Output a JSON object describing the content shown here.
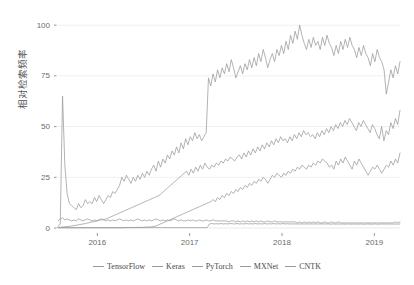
{
  "chart_data": {
    "type": "line",
    "title": "",
    "subtitle": "",
    "xlabel": "",
    "ylabel": "相对检索频率",
    "ylim": [
      0,
      105
    ],
    "yticks": [
      0,
      25,
      50,
      75,
      100
    ],
    "ytick_labels": [
      "0",
      "25",
      "50",
      "75",
      "100"
    ],
    "xlim": [
      "2015-08",
      "2019-04"
    ],
    "xticks": [
      "2016",
      "2017",
      "2018",
      "2019"
    ],
    "xtick_labels": [
      "2016",
      "2017",
      "2018",
      "2019"
    ],
    "grid": "horizontal",
    "legend_position": "bottom",
    "line_color": "#9a9a9a",
    "grid_color": "#e8e8e8",
    "background": "#ffffff",
    "series": [
      {
        "name": "TensorFlow",
        "color": "#9a9a9a",
        "values": [
          1,
          2,
          65,
          31,
          17,
          12,
          11,
          10,
          9,
          12,
          10,
          11,
          14,
          12,
          13,
          12,
          15,
          13,
          16,
          14,
          12,
          14,
          16,
          15,
          18,
          17,
          19,
          21,
          25,
          23,
          26,
          24,
          22,
          25,
          23,
          26,
          24,
          27,
          25,
          28,
          26,
          29,
          31,
          28,
          33,
          30,
          34,
          32,
          36,
          34,
          38,
          36,
          40,
          37,
          42,
          39,
          44,
          41,
          45,
          43,
          47,
          44,
          46,
          43,
          45,
          47,
          74,
          70,
          76,
          72,
          78,
          74,
          79,
          76,
          81,
          77,
          83,
          79,
          74,
          77,
          80,
          76,
          81,
          78,
          83,
          79,
          84,
          80,
          86,
          82,
          88,
          84,
          79,
          83,
          86,
          82,
          88,
          85,
          90,
          86,
          92,
          88,
          95,
          91,
          97,
          93,
          100,
          95,
          91,
          88,
          93,
          89,
          94,
          90,
          92,
          88,
          94,
          90,
          95,
          91,
          89,
          85,
          90,
          86,
          92,
          88,
          93,
          89,
          94,
          90,
          88,
          84,
          89,
          85,
          90,
          86,
          84,
          80,
          86,
          82,
          88,
          84,
          82,
          78,
          66,
          72,
          78,
          74,
          80,
          76,
          82
        ]
      },
      {
        "name": "Keras",
        "color": "#9a9a9a",
        "values": [
          0.3,
          0.4,
          0.5,
          0.6,
          0.7,
          0.8,
          1,
          1.2,
          1.4,
          1.6,
          1.8,
          2,
          2.2,
          2.5,
          2.8,
          3,
          3.2,
          3.5,
          3.8,
          4,
          4.2,
          4.5,
          5,
          5.5,
          6,
          6.5,
          7,
          7.5,
          8,
          8.5,
          9,
          9.5,
          10,
          10.5,
          11,
          11.5,
          12,
          12.5,
          13,
          13.5,
          14,
          14.5,
          15,
          15.5,
          16,
          17,
          18,
          19,
          20,
          21,
          22,
          23,
          24,
          25,
          26,
          27,
          28,
          26,
          29,
          27,
          30,
          28,
          31,
          29,
          32,
          30,
          29,
          31,
          30,
          32,
          31,
          33,
          32,
          34,
          33,
          35,
          34,
          33,
          35,
          36,
          34,
          37,
          35,
          38,
          36,
          39,
          37,
          40,
          38,
          41,
          39,
          42,
          40,
          43,
          41,
          44,
          42,
          45,
          43,
          44,
          42,
          45,
          43,
          46,
          44,
          47,
          45,
          48,
          46,
          47,
          45,
          46,
          44,
          47,
          45,
          48,
          46,
          49,
          47,
          50,
          48,
          51,
          49,
          52,
          50,
          53,
          51,
          54,
          52,
          50,
          48,
          52,
          50,
          53,
          51,
          49,
          47,
          51,
          49,
          46,
          44,
          50,
          43,
          48,
          46,
          52,
          49,
          54,
          51,
          58
        ]
      },
      {
        "name": "PyTorch",
        "color": "#9a9a9a",
        "values": [
          0.1,
          0.1,
          0.1,
          0.1,
          0.1,
          0.1,
          0.1,
          0.1,
          0.1,
          0.1,
          0.1,
          0.1,
          0.1,
          0.1,
          0.1,
          0.1,
          0.1,
          0.1,
          0.1,
          0.1,
          0.1,
          0.1,
          0.1,
          0.1,
          0.1,
          0.1,
          0.1,
          0.1,
          0.1,
          0.2,
          0.2,
          0.2,
          0.2,
          0.2,
          0.3,
          0.3,
          0.3,
          0.3,
          0.4,
          0.4,
          0.5,
          0.6,
          0.8,
          1,
          1.5,
          2,
          2.5,
          3,
          3.5,
          4,
          4.5,
          5,
          5.5,
          6,
          6.5,
          7,
          7.5,
          8,
          8.5,
          9,
          9.5,
          10,
          10.5,
          11,
          11.5,
          12,
          12.5,
          13,
          14,
          13,
          15,
          14,
          16,
          15,
          17,
          16,
          18,
          17,
          19,
          18,
          20,
          19,
          21,
          20,
          22,
          21,
          23,
          22,
          24,
          23,
          25,
          24,
          22,
          24,
          26,
          25,
          27,
          26,
          25,
          27,
          26,
          28,
          27,
          29,
          28,
          30,
          29,
          31,
          30,
          29,
          31,
          30,
          32,
          31,
          33,
          32,
          34,
          33,
          32,
          30,
          31,
          29,
          33,
          31,
          34,
          32,
          35,
          33,
          31,
          29,
          33,
          31,
          34,
          32,
          30,
          28,
          26,
          28,
          30,
          29,
          31,
          29,
          27,
          29,
          31,
          30,
          33,
          31,
          34,
          32,
          37
        ]
      },
      {
        "name": "MXNet",
        "color": "#9a9a9a",
        "values": [
          3.5,
          4.5,
          5,
          4,
          4.5,
          4,
          3.5,
          4,
          3.5,
          4.5,
          4,
          3.5,
          4,
          4.5,
          4,
          3.5,
          4,
          3.5,
          4,
          4.5,
          4,
          3.5,
          4,
          3.5,
          4,
          3.5,
          4,
          4.5,
          4,
          3.5,
          4,
          3.5,
          4,
          3.5,
          4,
          4.5,
          4,
          3.5,
          4,
          3.5,
          4,
          3.5,
          4,
          4.5,
          4,
          3.5,
          4,
          3.5,
          4,
          3.5,
          4,
          4.5,
          4,
          3.5,
          4,
          3.5,
          3.5,
          4,
          3.5,
          4,
          3.5,
          3.5,
          4,
          3.5,
          3.5,
          4,
          3.5,
          3.5,
          4,
          3.5,
          3.5,
          3.5,
          3.5,
          3.5,
          3.5,
          3,
          3.5,
          3.5,
          3,
          3.5,
          3,
          3.5,
          3,
          3.5,
          3,
          3.5,
          3,
          3.5,
          3,
          3.5,
          3,
          3,
          3.5,
          3,
          3,
          3.5,
          3,
          3,
          3,
          3,
          3,
          3,
          3,
          3,
          3,
          2.5,
          3,
          2.5,
          3,
          2.5,
          3,
          2.5,
          3,
          2.5,
          3,
          2.5,
          2.5,
          3,
          2.5,
          2.5,
          3,
          2.5,
          2.5,
          3,
          2.5,
          2.5,
          2.5,
          2.5,
          2.5,
          2.5,
          2.5,
          2.5,
          2.5,
          2.5,
          2.5,
          2.5,
          2.5,
          2.5,
          2.5,
          2.5,
          2.5,
          2.5,
          2.5,
          2.5,
          2.5,
          2.5,
          2.5,
          2.5,
          3,
          2.5,
          3
        ]
      },
      {
        "name": "CNTK",
        "color": "#9a9a9a",
        "values": [
          0.2,
          0.2,
          0.2,
          0.2,
          0.2,
          0.2,
          0.2,
          0.2,
          0.2,
          0.2,
          0.2,
          0.2,
          0.2,
          0.2,
          0.2,
          0.2,
          0.2,
          0.2,
          0.2,
          0.2,
          0.2,
          0.2,
          0.2,
          0.2,
          0.2,
          0.2,
          0.2,
          0.2,
          0.2,
          0.2,
          0.2,
          0.2,
          0.2,
          0.2,
          0.2,
          0.2,
          0.2,
          0.2,
          0.2,
          0.2,
          0.2,
          0.2,
          0.2,
          0.2,
          0.2,
          0.2,
          0.2,
          0.2,
          0.2,
          0.2,
          0.2,
          0.2,
          0.2,
          0.2,
          0.2,
          0.2,
          0.2,
          0.2,
          0.2,
          0.2,
          0.2,
          0.2,
          0.2,
          0.2,
          0.2,
          0.2,
          2,
          2.2,
          2,
          2.1,
          2,
          2.2,
          2,
          2.1,
          2,
          2.2,
          2.1,
          2,
          2.2,
          2,
          2.1,
          2,
          2.2,
          2,
          2.1,
          2,
          2.2,
          2,
          2.1,
          2,
          2.2,
          2,
          2.1,
          2,
          2.2,
          2,
          2.1,
          2,
          2.2,
          2,
          2.1,
          2,
          2,
          2,
          2,
          2,
          2,
          2,
          2,
          2,
          2,
          2,
          2,
          2,
          2,
          2,
          2,
          2,
          2,
          1.9,
          2,
          1.9,
          2,
          1.9,
          2,
          1.9,
          2,
          1.9,
          1.9,
          2,
          1.9,
          1.9,
          2,
          1.9,
          1.9,
          2,
          1.9,
          1.9,
          2,
          1.9,
          1.9,
          2,
          1.9,
          2,
          1.9,
          2,
          1.9,
          2,
          1.9,
          2
        ]
      }
    ]
  },
  "legend": {
    "items": [
      {
        "label": "TensorFlow"
      },
      {
        "label": "Keras"
      },
      {
        "label": "PyTorch"
      },
      {
        "label": "MXNet"
      },
      {
        "label": "CNTK"
      }
    ]
  },
  "axes": {
    "y_title": "相对检索频率",
    "y_labels": [
      "100",
      "75",
      "50",
      "25",
      "0"
    ],
    "x_labels": [
      "2016",
      "2017",
      "2018",
      "2019"
    ]
  }
}
